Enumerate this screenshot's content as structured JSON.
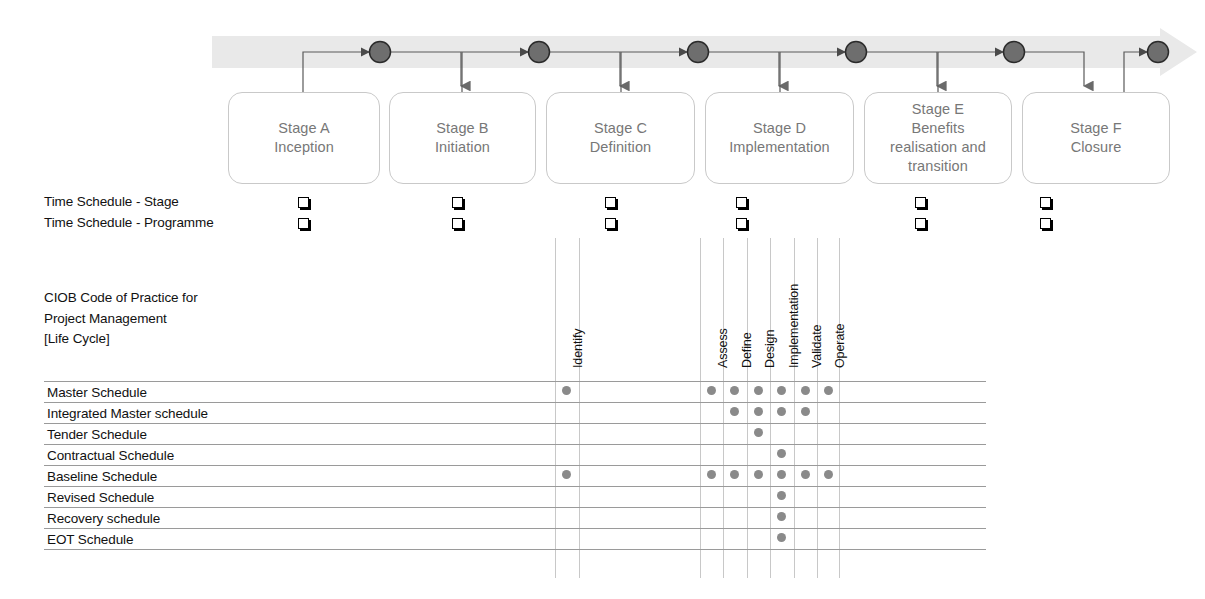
{
  "diagram": {
    "title_heading": "CIOB Code of Practice for\nProject Management\n[Life Cycle]",
    "band": {
      "name": "lifecycle-arrow-band",
      "color": "#e8e8e8",
      "milestone_color": "#6e6e6e"
    },
    "stages": [
      {
        "id": "stage-a",
        "label": "Stage A\nInception"
      },
      {
        "id": "stage-b",
        "label": "Stage B\nInitiation"
      },
      {
        "id": "stage-c",
        "label": "Stage C\nDefinition"
      },
      {
        "id": "stage-d",
        "label": "Stage D\nImplementation"
      },
      {
        "id": "stage-e",
        "label": "Stage E\nBenefits\nrealisation and\ntransition"
      },
      {
        "id": "stage-f",
        "label": "Stage F\nClosure"
      }
    ],
    "time_schedule_rows": [
      {
        "id": "time-schedule-stage",
        "label": "Time Schedule - Stage",
        "marks": [
          true,
          true,
          true,
          true,
          true,
          true
        ]
      },
      {
        "id": "time-schedule-programme",
        "label": "Time Schedule - Programme",
        "marks": [
          true,
          true,
          true,
          true,
          true,
          true
        ]
      }
    ],
    "matrix": {
      "columns": [
        {
          "id": "identify",
          "label": "Identify"
        },
        {
          "id": "assess",
          "label": "Assess"
        },
        {
          "id": "define",
          "label": "Define"
        },
        {
          "id": "design",
          "label": "Design"
        },
        {
          "id": "implementation",
          "label": "Implementation"
        },
        {
          "id": "validate",
          "label": "Validate"
        },
        {
          "id": "operate",
          "label": "Operate"
        }
      ],
      "rows": [
        {
          "id": "master-schedule",
          "label": "Master Schedule",
          "dots": {
            "identify": true,
            "assess": true,
            "define": true,
            "design": true,
            "implementation": true,
            "validate": true,
            "operate": true
          }
        },
        {
          "id": "integrated-master-schedule",
          "label": "Integrated Master schedule",
          "dots": {
            "identify": false,
            "assess": false,
            "define": true,
            "design": true,
            "implementation": true,
            "validate": true,
            "operate": false
          }
        },
        {
          "id": "tender-schedule",
          "label": "Tender Schedule",
          "dots": {
            "identify": false,
            "assess": false,
            "define": false,
            "design": true,
            "implementation": false,
            "validate": false,
            "operate": false
          }
        },
        {
          "id": "contractual-schedule",
          "label": "Contractual Schedule",
          "dots": {
            "identify": false,
            "assess": false,
            "define": false,
            "design": false,
            "implementation": true,
            "validate": false,
            "operate": false
          }
        },
        {
          "id": "baseline-schedule",
          "label": "Baseline Schedule",
          "dots": {
            "identify": true,
            "assess": true,
            "define": true,
            "design": true,
            "implementation": true,
            "validate": true,
            "operate": true
          }
        },
        {
          "id": "revised-schedule",
          "label": "Revised Schedule",
          "dots": {
            "identify": false,
            "assess": false,
            "define": false,
            "design": false,
            "implementation": true,
            "validate": false,
            "operate": false
          }
        },
        {
          "id": "recovery-schedule",
          "label": "Recovery schedule",
          "dots": {
            "identify": false,
            "assess": false,
            "define": false,
            "design": false,
            "implementation": true,
            "validate": false,
            "operate": false
          }
        },
        {
          "id": "eot-schedule",
          "label": "EOT Schedule",
          "dots": {
            "identify": false,
            "assess": false,
            "define": false,
            "design": false,
            "implementation": true,
            "validate": false,
            "operate": false
          }
        }
      ],
      "dot_color": "#8a8a8a",
      "grid_color": "#c8c8c8"
    }
  }
}
